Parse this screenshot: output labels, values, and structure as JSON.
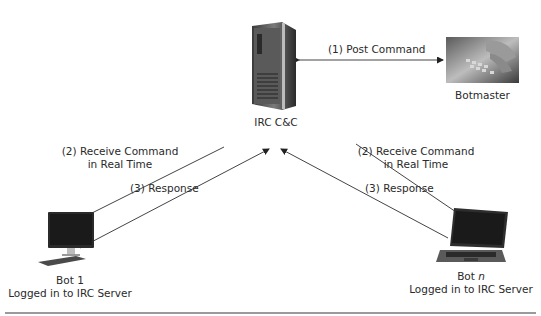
{
  "diagram": {
    "nodes": {
      "server": {
        "label": "IRC C&C",
        "icon": "server-tower-icon"
      },
      "botmaster": {
        "label": "Botmaster",
        "icon": "keyboard-hands-photo"
      },
      "bot1": {
        "label_line1": "Bot 1",
        "label_line2": "Logged in to IRC Server",
        "icon": "desktop-computer-icon"
      },
      "botn": {
        "label_line1_prefix": "Bot ",
        "label_line1_var": "n",
        "label_line2": "Logged in to IRC Server",
        "icon": "laptop-icon"
      }
    },
    "edges": {
      "post_command": {
        "label": "(1) Post Command",
        "from": "Botmaster",
        "to": "IRC C&C",
        "bidirectional": true
      },
      "receive_left": {
        "label_line1": "(2) Receive Command",
        "label_line2": "in Real Time",
        "from": "IRC C&C",
        "to": "Bot 1"
      },
      "response_left": {
        "label": "(3) Response",
        "from": "Bot 1",
        "to": "IRC C&C"
      },
      "receive_right": {
        "label_line1": "(2) Receive Command",
        "label_line2": "in Real Time",
        "from": "IRC C&C",
        "to": "Bot n"
      },
      "response_right": {
        "label": "(3) Response",
        "from": "Bot n",
        "to": "IRC C&C"
      }
    },
    "colors": {
      "line": "#444444",
      "rule": "#9a9a9a"
    }
  }
}
